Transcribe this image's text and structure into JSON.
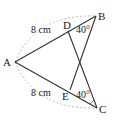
{
  "diagram": {
    "points": {
      "A": {
        "label": "A",
        "x": 15,
        "y": 62
      },
      "B": {
        "label": "B",
        "x": 96,
        "y": 16
      },
      "C": {
        "label": "C",
        "x": 97,
        "y": 108
      },
      "D": {
        "label": "D",
        "x": 68,
        "y": 31
      },
      "E": {
        "label": "E",
        "x": 70,
        "y": 90
      }
    },
    "segments": [
      [
        "A",
        "B"
      ],
      [
        "A",
        "C"
      ],
      [
        "D",
        "C"
      ],
      [
        "E",
        "B"
      ]
    ],
    "dashed_arcs": [
      [
        "A",
        "B"
      ],
      [
        "A",
        "C"
      ]
    ],
    "labels": {
      "AD_length": "8 cm",
      "AE_length": "8 cm",
      "angle_DB": "40°",
      "angle_EC": "40°"
    },
    "colors": {
      "line": "#333333",
      "dashed": "#aaaaaa"
    }
  }
}
